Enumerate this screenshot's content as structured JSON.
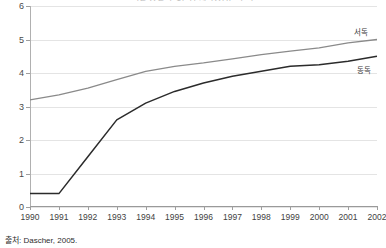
{
  "chart_data": {
    "type": "line",
    "title": "독일 통일 후 1인당 지역총생산 추이",
    "xlabel": "",
    "ylabel": "",
    "x": [
      1990,
      1991,
      1992,
      1993,
      1994,
      1995,
      1996,
      1997,
      1998,
      1999,
      2000,
      2001,
      2002
    ],
    "categories": [
      "1990",
      "1991",
      "1992",
      "1993",
      "1994",
      "1995",
      "1996",
      "1997",
      "1998",
      "1999",
      "2000",
      "2001",
      "2002"
    ],
    "ylim": [
      0,
      6
    ],
    "y_ticks": [
      0,
      1,
      2,
      3,
      4,
      5,
      6
    ],
    "grid": true,
    "legend_position": "right-inline",
    "series": [
      {
        "name": "서독",
        "color": "#8a8a8a",
        "values": [
          3.2,
          3.35,
          3.55,
          3.8,
          4.05,
          4.2,
          4.3,
          4.42,
          4.55,
          4.65,
          4.75,
          4.9,
          5.0
        ]
      },
      {
        "name": "동독",
        "color": "#2b2b2b",
        "values": [
          0.4,
          0.4,
          1.5,
          2.6,
          3.1,
          3.45,
          3.7,
          3.9,
          4.05,
          4.2,
          4.25,
          4.35,
          4.5
        ]
      }
    ],
    "source": "출처: Dascher, 2005."
  },
  "axis": {
    "y_tick_labels": [
      "0",
      "1",
      "2",
      "3",
      "4",
      "5",
      "6"
    ],
    "x_tick_labels": [
      "1990",
      "1991",
      "1992",
      "1993",
      "1994",
      "1995",
      "1996",
      "1997",
      "1998",
      "1999",
      "2000",
      "2001",
      "2002"
    ]
  },
  "legend": {
    "west_label": "서독",
    "east_label": "동독"
  },
  "footer": {
    "source": "출처: Dascher, 2005."
  }
}
